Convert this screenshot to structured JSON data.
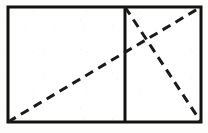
{
  "figure": {
    "canvas": {
      "width": 208,
      "height": 133
    },
    "background_color": "#fdfdfb",
    "ink_color": "#111111",
    "dash_color": "#1a1a1a",
    "fill_color": "#ffffff",
    "outer_rectangle": {
      "name": "outer-rectangle",
      "left": 8,
      "top": 7,
      "right": 201,
      "bottom": 122,
      "width": 193,
      "height": 115,
      "stroke_width": 3,
      "style": "solid"
    },
    "divider": {
      "name": "vertical-divider",
      "x": 125,
      "y_top": 7,
      "y_bottom": 122,
      "stroke_width": 3,
      "style": "solid"
    },
    "sub_rectangles": [
      {
        "name": "left-sub-rectangle",
        "left": 8,
        "top": 7,
        "right": 125,
        "bottom": 122,
        "width": 117,
        "height": 115
      },
      {
        "name": "right-sub-rectangle",
        "left": 125,
        "top": 7,
        "right": 201,
        "bottom": 122,
        "width": 76,
        "height": 115
      }
    ],
    "dashed_lines": [
      {
        "name": "main-diagonal",
        "from": {
          "x": 8,
          "y": 122
        },
        "to": {
          "x": 201,
          "y": 7
        },
        "stroke_width": 3,
        "dash_array": "9 6",
        "style": "dashed",
        "description": "diagonal of the full rectangle, bottom-left to top-right"
      },
      {
        "name": "right-sub-diagonal",
        "from": {
          "x": 125,
          "y": 7
        },
        "to": {
          "x": 201,
          "y": 122
        },
        "stroke_width": 3,
        "dash_array": "9 6",
        "style": "dashed",
        "description": "diagonal of the right sub-rectangle, top-left to bottom-right"
      }
    ],
    "intersection_point": {
      "name": "diagonal-intersection",
      "x": 145,
      "y": 41
    },
    "vertices": [
      {
        "name": "vertex-top-left",
        "x": 8,
        "y": 7
      },
      {
        "name": "vertex-top-right",
        "x": 201,
        "y": 7
      },
      {
        "name": "vertex-bottom-right",
        "x": 201,
        "y": 122
      },
      {
        "name": "vertex-bottom-left",
        "x": 8,
        "y": 122
      },
      {
        "name": "vertex-divider-top",
        "x": 125,
        "y": 7
      },
      {
        "name": "vertex-divider-bottom",
        "x": 125,
        "y": 122
      }
    ],
    "labels": []
  }
}
